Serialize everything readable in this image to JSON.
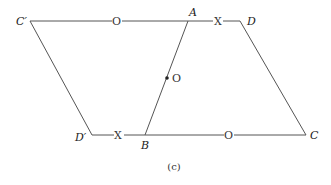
{
  "figure": {
    "caption": "(c)",
    "points": {
      "C_prime": {
        "label": "C′",
        "x": 30,
        "y": 21
      },
      "A": {
        "label": "A",
        "x": 188,
        "y": 21
      },
      "D": {
        "label": "D",
        "x": 240,
        "y": 21
      },
      "D_prime": {
        "label": "D′",
        "x": 92,
        "y": 135
      },
      "B": {
        "label": "B",
        "x": 145,
        "y": 135
      },
      "C": {
        "label": "C",
        "x": 306,
        "y": 135
      }
    },
    "center": {
      "label": "O",
      "x": 167,
      "y": 78
    },
    "marks": {
      "top_o": "O",
      "top_x": "X",
      "bottom_x": "X",
      "bottom_o": "O"
    }
  }
}
